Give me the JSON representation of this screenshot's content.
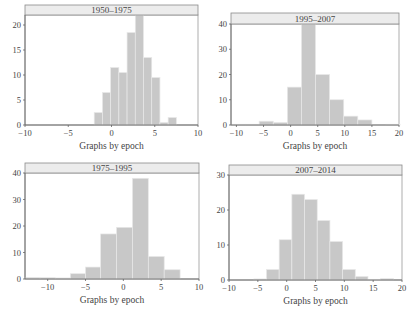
{
  "figure": {
    "shared_xlabel": "Graphs by epoch",
    "colors": {
      "bar_fill": "#c8c8c8",
      "bar_stroke": "#e8e8e8",
      "title_bar_fill": "#ececec",
      "axis": "#666666"
    }
  },
  "chart_data": [
    {
      "type": "bar",
      "title": "1950–1975",
      "xlabel": "Graphs by epoch",
      "ylabel": "",
      "xlim": [
        -10,
        10
      ],
      "ylim": [
        0,
        22
      ],
      "xticks": [
        -10,
        -5,
        0,
        5,
        10
      ],
      "yticks": [
        0,
        5,
        10,
        15,
        20
      ],
      "bins": [
        {
          "x0": -2.0,
          "x1": -1.05,
          "value": 2.5
        },
        {
          "x0": -1.05,
          "x1": -0.1,
          "value": 6.5
        },
        {
          "x0": -0.1,
          "x1": 0.85,
          "value": 11.5
        },
        {
          "x0": 0.85,
          "x1": 1.8,
          "value": 10.5
        },
        {
          "x0": 1.8,
          "x1": 2.75,
          "value": 18.5
        },
        {
          "x0": 2.75,
          "x1": 3.7,
          "value": 22
        },
        {
          "x0": 3.7,
          "x1": 4.65,
          "value": 13.5
        },
        {
          "x0": 4.65,
          "x1": 5.6,
          "value": 9.5
        },
        {
          "x0": 5.6,
          "x1": 6.55,
          "value": 0.5
        },
        {
          "x0": 6.55,
          "x1": 7.5,
          "value": 1.5
        }
      ]
    },
    {
      "type": "bar",
      "title": "1995–2007",
      "xlabel": "Graphs by epoch",
      "ylabel": "",
      "xlim": [
        -11,
        20
      ],
      "ylim": [
        0,
        40
      ],
      "xticks": [
        -10,
        -5,
        0,
        5,
        10,
        15,
        20
      ],
      "yticks": [
        0,
        10,
        20,
        30,
        40
      ],
      "bins": [
        {
          "x0": -11.0,
          "x1": -8.4,
          "value": 0.3
        },
        {
          "x0": -8.4,
          "x1": -5.8,
          "value": 0.3
        },
        {
          "x0": -5.8,
          "x1": -3.2,
          "value": 1.5
        },
        {
          "x0": -3.2,
          "x1": -0.6,
          "value": 1
        },
        {
          "x0": -0.6,
          "x1": 2.0,
          "value": 15
        },
        {
          "x0": 2.0,
          "x1": 4.6,
          "value": 40
        },
        {
          "x0": 4.6,
          "x1": 7.2,
          "value": 20
        },
        {
          "x0": 7.2,
          "x1": 9.8,
          "value": 10
        },
        {
          "x0": 9.8,
          "x1": 12.4,
          "value": 3.5
        },
        {
          "x0": 12.4,
          "x1": 15.0,
          "value": 2
        },
        {
          "x0": 15.0,
          "x1": 17.6,
          "value": 0.1
        },
        {
          "x0": 17.6,
          "x1": 20.2,
          "value": 0.3
        }
      ]
    },
    {
      "type": "bar",
      "title": "1975–1995",
      "xlabel": "Graphs by epoch",
      "ylabel": "",
      "xlim": [
        -13,
        10
      ],
      "ylim": [
        0,
        40
      ],
      "xticks": [
        -10,
        -5,
        0,
        5,
        10
      ],
      "yticks": [
        0,
        10,
        20,
        30,
        40
      ],
      "bins": [
        {
          "x0": -13.0,
          "x1": -11.0,
          "value": 0.6
        },
        {
          "x0": -11.0,
          "x1": -9.0,
          "value": 0.5
        },
        {
          "x0": -9.0,
          "x1": -7.0,
          "value": 0.4
        },
        {
          "x0": -7.0,
          "x1": -5.0,
          "value": 2
        },
        {
          "x0": -5.0,
          "x1": -3.0,
          "value": 4.5
        },
        {
          "x0": -3.0,
          "x1": -0.9,
          "value": 17
        },
        {
          "x0": -0.9,
          "x1": 1.2,
          "value": 19.5
        },
        {
          "x0": 1.2,
          "x1": 3.3,
          "value": 38
        },
        {
          "x0": 3.3,
          "x1": 5.4,
          "value": 8.5
        },
        {
          "x0": 5.4,
          "x1": 7.5,
          "value": 3.5
        }
      ]
    },
    {
      "type": "bar",
      "title": "2007–2014",
      "xlabel": "Graphs by epoch",
      "ylabel": "",
      "xlim": [
        -10,
        20
      ],
      "ylim": [
        0,
        30
      ],
      "xticks": [
        -10,
        -5,
        0,
        5,
        10,
        15,
        20
      ],
      "yticks": [
        0,
        10,
        20,
        30
      ],
      "bins": [
        {
          "x0": -5.7,
          "x1": -3.5,
          "value": 0.3
        },
        {
          "x0": -3.5,
          "x1": -1.3,
          "value": 3
        },
        {
          "x0": -1.3,
          "x1": 0.9,
          "value": 11.5
        },
        {
          "x0": 0.9,
          "x1": 3.1,
          "value": 24.5
        },
        {
          "x0": 3.1,
          "x1": 5.3,
          "value": 23
        },
        {
          "x0": 5.3,
          "x1": 7.5,
          "value": 17
        },
        {
          "x0": 7.5,
          "x1": 9.7,
          "value": 11
        },
        {
          "x0": 9.7,
          "x1": 11.9,
          "value": 3
        },
        {
          "x0": 11.9,
          "x1": 14.1,
          "value": 1
        },
        {
          "x0": 14.1,
          "x1": 16.3,
          "value": 0.2
        },
        {
          "x0": 16.3,
          "x1": 18.5,
          "value": 0.4
        }
      ]
    }
  ]
}
